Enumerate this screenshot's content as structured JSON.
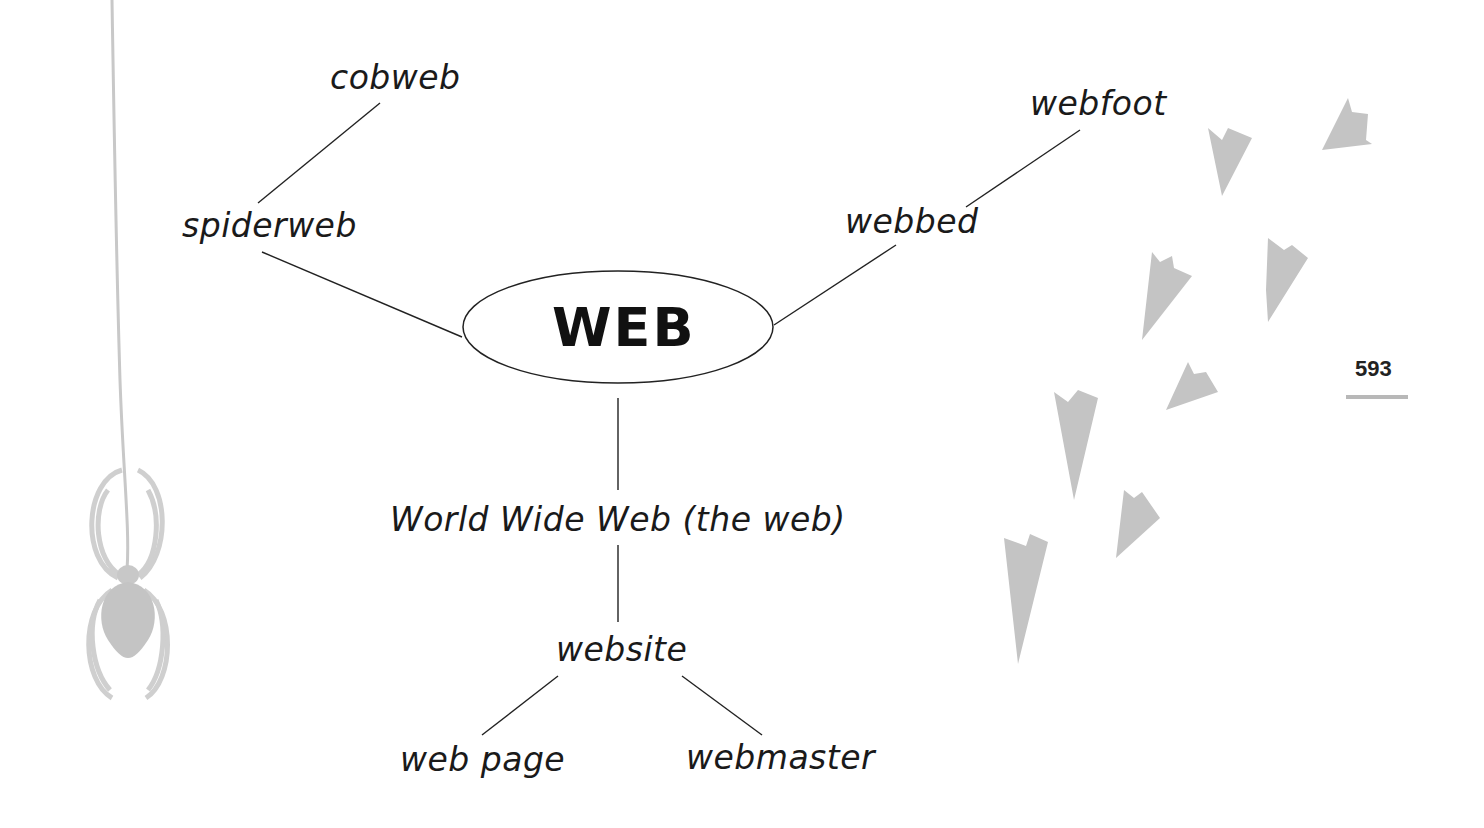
{
  "diagram": {
    "center": {
      "label": "WEB"
    },
    "nodes": [
      {
        "id": "cobweb",
        "label": "cobweb"
      },
      {
        "id": "spiderweb",
        "label": "spiderweb"
      },
      {
        "id": "webfoot",
        "label": "webfoot"
      },
      {
        "id": "webbed",
        "label": "webbed"
      },
      {
        "id": "www",
        "label": "World Wide Web (the web)"
      },
      {
        "id": "website",
        "label": "website"
      },
      {
        "id": "webpage",
        "label": "web page"
      },
      {
        "id": "webmaster",
        "label": "webmaster"
      }
    ],
    "edges": [
      [
        "cobweb",
        "spiderweb"
      ],
      [
        "spiderweb",
        "WEB"
      ],
      [
        "webfoot",
        "webbed"
      ],
      [
        "webbed",
        "WEB"
      ],
      [
        "WEB",
        "www"
      ],
      [
        "www",
        "website"
      ],
      [
        "website",
        "webpage"
      ],
      [
        "website",
        "webmaster"
      ]
    ]
  },
  "page": {
    "number": "593"
  },
  "decorations": {
    "spider_color": "#c8c8c8",
    "footprint_color": "#c4c4c4",
    "footprint_count": 8
  }
}
